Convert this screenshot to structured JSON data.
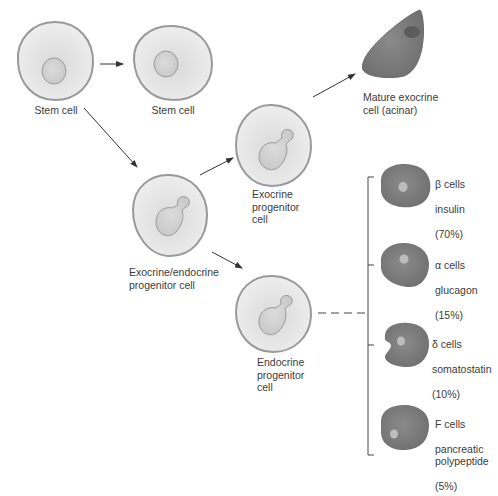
{
  "colors": {
    "cell_fill": "#e6e6e6",
    "cell_outline": "#9a9a9a",
    "nucleus_fill": "#cfcfcf",
    "mature_cell_fill": "#7a7a7a",
    "mature_nucleus": "#5c5c5c",
    "endocrine_cell_fill": "#7f7f7f",
    "endocrine_nucleus": "#bdbdbd",
    "arrow": "#333333"
  },
  "nodes": {
    "stem_cell_1": {
      "label": "Stem cell"
    },
    "stem_cell_2": {
      "label": "Stem cell"
    },
    "exo_endo_progenitor": {
      "label": "Exocrine/endocrine\nprogenitor cell"
    },
    "exocrine_progenitor": {
      "label": "Exocrine\nprogenitor\ncell"
    },
    "mature_exocrine": {
      "label": "Mature exocrine\ncell (acinar)"
    },
    "endocrine_progenitor": {
      "label": "Endocrine\nprogenitor\ncell"
    }
  },
  "endocrine_cells": [
    {
      "type": "β cells",
      "hormone": "insulin",
      "percent": "(70%)"
    },
    {
      "type": "α cells",
      "hormone": "glucagon",
      "percent": "(15%)"
    },
    {
      "type": "δ cells",
      "hormone": "somatostatin",
      "percent": "(10%)"
    },
    {
      "type": "F cells",
      "hormone": "pancreatic\npolypeptide",
      "percent": "(5%)"
    }
  ],
  "edges": [
    {
      "from": "stem_cell_1",
      "to": "stem_cell_2",
      "style": "arrow"
    },
    {
      "from": "stem_cell_1",
      "to": "exo_endo_progenitor",
      "style": "arrow"
    },
    {
      "from": "exo_endo_progenitor",
      "to": "exocrine_progenitor",
      "style": "arrow"
    },
    {
      "from": "exocrine_progenitor",
      "to": "mature_exocrine",
      "style": "arrow"
    },
    {
      "from": "exo_endo_progenitor",
      "to": "endocrine_progenitor",
      "style": "arrow"
    },
    {
      "from": "endocrine_progenitor",
      "to": "endocrine_cells",
      "style": "dashed-bracket"
    }
  ]
}
